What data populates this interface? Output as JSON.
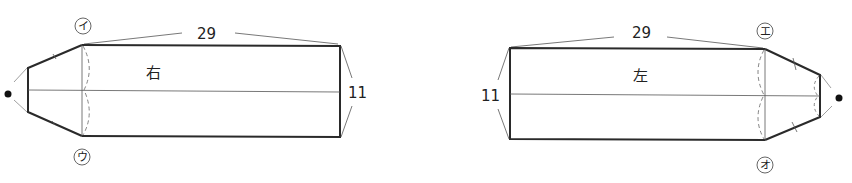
{
  "diagram": {
    "type": "knitting-pattern-schematic",
    "pieces": [
      {
        "id": "right",
        "label": "右",
        "length_label": "29",
        "width_label": "11",
        "marker_top": "イ",
        "marker_bottom": "ウ",
        "tip_side": "left"
      },
      {
        "id": "left",
        "label": "左",
        "length_label": "29",
        "width_label": "11",
        "marker_top": "エ",
        "marker_bottom": "オ",
        "tip_side": "right"
      }
    ]
  },
  "colors": {
    "outline": "#2a2a2a",
    "thin_line": "#555555",
    "dashed": "#777777",
    "text": "#222222"
  }
}
